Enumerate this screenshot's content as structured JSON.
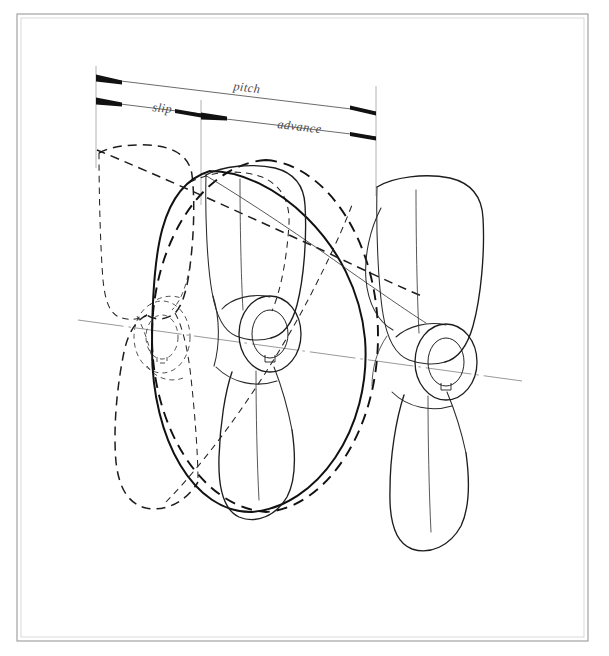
{
  "figure": {
    "kind": "technical-line-drawing",
    "background_color": "#ffffff",
    "ink_color": "#1d1d1d",
    "dimension_line_color": "#5a5a5a",
    "axis_color": "#8d8d8d",
    "frame_color": "#9a9a9a"
  },
  "frame": {
    "name": "plate-border",
    "x": 17,
    "y": 14,
    "width": 571,
    "height": 627
  },
  "dimensions": {
    "pitch": {
      "label": "pitch",
      "label_x": 233,
      "label_y": 90,
      "from_x": 96,
      "from_y": 78,
      "to_x": 376,
      "to_y": 112
    },
    "slip": {
      "label": "slip",
      "label_x": 152,
      "label_y": 111,
      "from_x": 96,
      "from_y": 101,
      "to_x": 201,
      "to_y": 114
    },
    "advance": {
      "label": "advance",
      "label_x": 277,
      "label_y": 128,
      "from_x": 201,
      "from_y": 116,
      "to_x": 376,
      "to_y": 137
    }
  },
  "extension_lines": [
    {
      "name": "extension-line-left",
      "x_top": 96,
      "y_top": 66,
      "x_bottom": 96,
      "y_bottom": 160
    },
    {
      "name": "extension-line-middle",
      "x_top": 201,
      "y_top": 101,
      "x_bottom": 201,
      "y_bottom": 200
    },
    {
      "name": "extension-line-right",
      "x_top": 376,
      "y_top": 88,
      "x_bottom": 376,
      "y_bottom": 190
    }
  ],
  "shaft_axis": {
    "name": "shaft-centre-line",
    "from_x": 78,
    "from_y": 320,
    "to_x": 522,
    "to_y": 381,
    "style": "dash-dot"
  },
  "propellers": [
    {
      "name": "propeller-initial-position",
      "line_style": "dashed",
      "hub_cx": 160,
      "hub_cy": 337,
      "blade_count": 3
    },
    {
      "name": "propeller-advanced-position",
      "line_style": "solid",
      "hub_cx": 267,
      "hub_cy": 334,
      "blade_count": 3
    },
    {
      "name": "propeller-final-position",
      "line_style": "solid",
      "hub_cx": 443,
      "hub_cy": 362,
      "blade_count": 3
    }
  ],
  "helix_circles": [
    {
      "name": "pitch-circle-dashed",
      "cx": 265,
      "cy": 335,
      "rx": 112,
      "ry": 178,
      "style": "dashed"
    },
    {
      "name": "pitch-circle-solid",
      "cx": 272,
      "cy": 338,
      "rx": 112,
      "ry": 178,
      "style": "solid"
    }
  ]
}
